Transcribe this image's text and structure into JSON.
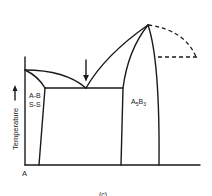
{
  "diagram": {
    "type": "binary-phase-diagram",
    "y_axis_label": "Temperature",
    "x_axis_origin_label": "A",
    "regions": [
      {
        "label_line1": "A-B",
        "label_line2": "S-S"
      },
      {
        "label_main": "A",
        "label_sub1": "5",
        "label_main2": "B",
        "label_sub2": "3"
      }
    ],
    "annotations": [
      "eutectic-arrow"
    ],
    "caption": "(c)",
    "stroke_color": "#1a1a1a",
    "background": "#ffffff"
  }
}
